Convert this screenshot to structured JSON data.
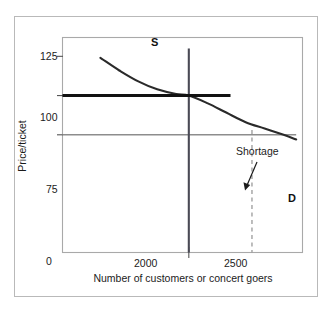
{
  "figure": {
    "top_caption": "",
    "background_color": "#ffffff",
    "frame_color": "#b9b9b9"
  },
  "chart_data": {
    "type": "line",
    "title": "",
    "xlabel": "Number of customers or concert goers",
    "ylabel": "Price/ticket",
    "xlim": [
      1000,
      2900
    ],
    "ylim": [
      0,
      137
    ],
    "grid": false,
    "legend": "none",
    "x_ticks": [
      "0",
      "2000",
      "2500"
    ],
    "x_tick_values": [
      1000,
      2000,
      2500
    ],
    "y_ticks": [
      "0",
      "75",
      "100",
      "125"
    ],
    "y_tick_values": [
      0,
      75,
      100,
      125
    ],
    "series": [
      {
        "name": "D",
        "label": "D",
        "role": "demand-curve",
        "color": "#2a2a2a",
        "style": "solid",
        "width": 2.0,
        "x": [
          1300,
          1450,
          1600,
          1750,
          1900,
          2000,
          2150,
          2300,
          2450,
          2600,
          2750,
          2850
        ],
        "y": [
          124,
          116,
          109,
          104,
          101,
          100,
          95,
          89,
          83,
          79,
          75,
          72
        ]
      },
      {
        "name": "S",
        "label": "S",
        "role": "supply-line-vertical",
        "color": "#4a4a55",
        "style": "solid",
        "width": 2.0,
        "x_value": 2000,
        "y_from": 0,
        "y_to": 130
      },
      {
        "name": "price-100-line",
        "label": "",
        "role": "equilibrium-price-line",
        "color": "#111111",
        "style": "solid",
        "width": 3.0,
        "y_value": 100,
        "x_from": 1000,
        "x_to": 2330
      },
      {
        "name": "price-75-line",
        "label": "",
        "role": "ceiling-price-line",
        "color": "#8d8d8d",
        "style": "solid",
        "width": 1.4,
        "y_value": 75,
        "x_from": 1000,
        "x_to": 2850
      },
      {
        "name": "quantity-2500-dashed",
        "label": "",
        "role": "quantity-demanded-dropline",
        "color": "#9a9a9a",
        "style": "dashed",
        "width": 1.2,
        "x_value": 2500,
        "y_from": 0,
        "y_to": 78
      }
    ],
    "annotations": [
      {
        "text": "Shortage",
        "role": "shortage-callout",
        "text_x": 2620,
        "text_y": 113,
        "arrow_from_x": 2580,
        "arrow_from_y": 100,
        "arrow_to_x": 2505,
        "arrow_to_y": 78,
        "color": "#1b1b1b"
      }
    ],
    "curve_labels": [
      {
        "text": "S",
        "x": 2000,
        "y": 133
      },
      {
        "text": "D",
        "x": 2880,
        "y": 72
      }
    ],
    "equilibrium_point": {
      "x": 2000,
      "y": 100
    },
    "shortage_point": {
      "x": 2500,
      "y": 75
    }
  }
}
